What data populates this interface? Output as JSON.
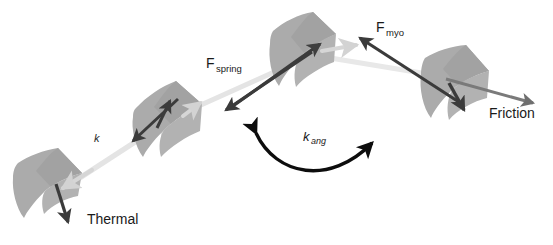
{
  "figure": {
    "background_color": "#ffffff",
    "width": 553,
    "height": 245
  },
  "colors": {
    "bead_fill": "#ababab",
    "bead_fill_shadow": "#9d9d9d",
    "dark_arrow": "#3b3b3b",
    "mid_arrow": "#6f6f6f",
    "light_arrow": "#d8d8d8",
    "backbone": "#e2e2e2",
    "label_text": "#1a1a1a",
    "kang_arc": "#0d0d0d"
  },
  "labels": {
    "f_spring": {
      "base": "F",
      "sub": "spring"
    },
    "f_myo": {
      "base": "F",
      "sub": "myo"
    },
    "friction": {
      "text": "Friction"
    },
    "thermal": {
      "text": "Thermal"
    },
    "k": {
      "text": "k"
    },
    "k_ang": {
      "base": "k",
      "sub": "ang"
    }
  },
  "beads": [
    {
      "name": "bead-1",
      "position": "lower-left"
    },
    {
      "name": "bead-2",
      "position": "left-mid"
    },
    {
      "name": "bead-3",
      "position": "top-center"
    },
    {
      "name": "bead-4",
      "position": "right"
    }
  ],
  "forces": [
    {
      "name": "thermal-force",
      "label": "Thermal",
      "style": "dark",
      "direction": "down-right"
    },
    {
      "name": "spring-force",
      "label": "F_spring",
      "style": "dark",
      "direction": "down-left"
    },
    {
      "name": "myosin-force",
      "label": "F_myo",
      "style": "dark",
      "direction": "up-left"
    },
    {
      "name": "friction-force",
      "label": "Friction",
      "style": "mid",
      "direction": "right"
    },
    {
      "name": "bending-stiffness",
      "label": "k_ang",
      "style": "arc-double",
      "direction": "bidirectional"
    },
    {
      "name": "spring-constant",
      "label": "k",
      "style": "backbone",
      "direction": "along-filament"
    }
  ]
}
